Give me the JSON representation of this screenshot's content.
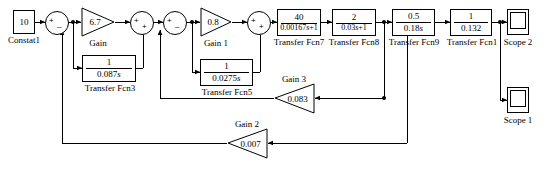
{
  "diagram": {
    "line_color": "#000000",
    "background": "#ffffff"
  },
  "blocks": {
    "constant": {
      "value": "10",
      "label": "Constat1"
    },
    "gain": {
      "value": "6.7",
      "label": "Gain"
    },
    "gain1": {
      "value": "0.8",
      "label": "Gain 1"
    },
    "gain2": {
      "value": "0.007",
      "label": "Gain 2"
    },
    "gain3": {
      "value": "0.083",
      "label": "Gain 3"
    },
    "tf3": {
      "num": "1",
      "den_coeff": "0.087",
      "den_var": "s",
      "label": "Transfer Fcn3"
    },
    "tf5": {
      "num": "1",
      "den_coeff": "0.0275",
      "den_var": "s",
      "label": "Transfer Fcn5"
    },
    "tf7": {
      "num": "40",
      "den_coeff": "0.00167",
      "den_var": "s",
      "den_tail": "+1",
      "label": "Transfer Fcn7"
    },
    "tf8": {
      "num": "2",
      "den_coeff": "0.03",
      "den_var": "s",
      "den_tail": "+1",
      "label": "Transfer Fcn8"
    },
    "tf9": {
      "num": "0.5",
      "den_coeff": "0.18",
      "den_var": "s",
      "label": "Transfer Fcn9"
    },
    "tf1": {
      "num": "1",
      "den_coeff": "0.132",
      "den_var": "",
      "label": "Transfer Fcn1"
    },
    "scope1": {
      "label": "Scope 1"
    },
    "scope2": {
      "label": "Scope 2"
    }
  },
  "sums": {
    "sum1": {
      "plus": "+",
      "minus": "–"
    },
    "sum2": {
      "plus": "+",
      "minus": "+"
    },
    "sum3": {
      "plus": "+",
      "minus": "–"
    },
    "sum4": {
      "plus": "+",
      "minus": "+"
    }
  }
}
